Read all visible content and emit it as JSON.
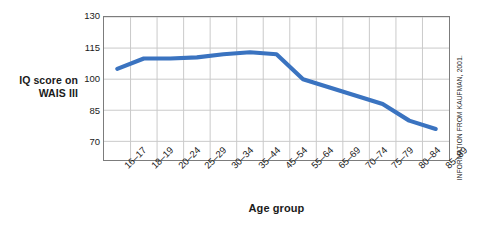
{
  "chart_data": {
    "type": "line",
    "title": "",
    "xlabel": "Age group",
    "ylabel_lines": [
      "IQ score on",
      "WAIS III"
    ],
    "ylabel": "IQ score on WAIS III",
    "categories": [
      "16–17",
      "18–19",
      "20–24",
      "25–29",
      "30–34",
      "35–44",
      "45–54",
      "55–64",
      "65–69",
      "70–74",
      "75–79",
      "80–84",
      "85–89"
    ],
    "values": [
      105,
      110,
      110,
      110.5,
      112,
      113,
      112,
      100,
      96,
      92,
      88,
      80,
      76
    ],
    "series": [
      {
        "name": "IQ score on WAIS III",
        "values": [
          105,
          110,
          110,
          110.5,
          112,
          113,
          112,
          100,
          96,
          92,
          88,
          80,
          76
        ]
      }
    ],
    "yticks": [
      70,
      85,
      100,
      115,
      130
    ],
    "ylim": [
      61,
      130
    ],
    "ytick_labels": [
      "70",
      "85",
      "100",
      "115",
      "130"
    ],
    "grid": true,
    "legend": "none",
    "line_color": "#3a73c0",
    "grid_color": "#c9c9c9",
    "axis_color": "#7c7c7c",
    "text_color": "#1a1a1a",
    "background": "#ffffff"
  },
  "annotations": {
    "source_credit": "INFORMATION FROM KAUFMAN, 2001."
  }
}
